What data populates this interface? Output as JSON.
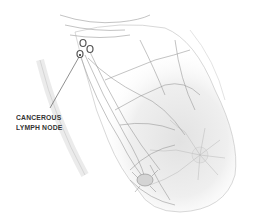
{
  "diagram": {
    "annotation": {
      "line1": "CANCEROUS",
      "line2": "LYMPH NODE"
    },
    "colors": {
      "background": "#ffffff",
      "line": "#9a9a9a",
      "node": "#555555",
      "label": "#333333",
      "shade": "#e6e6e6"
    }
  }
}
